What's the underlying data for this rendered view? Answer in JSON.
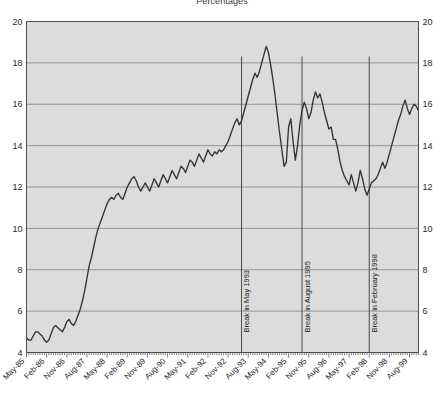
{
  "chart_data": {
    "type": "line",
    "title": "Percentages",
    "xlabel": "",
    "ylabel": "",
    "ylim": [
      4,
      20
    ],
    "yticks": [
      4,
      6,
      8,
      10,
      12,
      14,
      16,
      18,
      20
    ],
    "grid": true,
    "legend": "none",
    "y_axis_right": true,
    "x_tick_labels": [
      "May-85",
      "Feb-86",
      "Nov-86",
      "Aug-87",
      "May-88",
      "Feb-89",
      "Nov-89",
      "Aug-90",
      "May-91",
      "Feb-92",
      "Nov-92",
      "Aug-93",
      "May-94",
      "Feb-95",
      "Nov-95",
      "Aug-96",
      "May-97",
      "Feb-98",
      "Nov-98",
      "Aug-99",
      "May-00",
      "Feb-01"
    ],
    "x_label_interval_months": 9,
    "x_start": "May-85",
    "x_end": "Feb-01",
    "annotations": [
      {
        "label": "Break in May 1993",
        "x_value": "May-93"
      },
      {
        "label": "Break in August 1995",
        "x_value": "Aug-95"
      },
      {
        "label": "Break in February 1998",
        "x_value": "Feb-98"
      }
    ],
    "series": [
      {
        "name": "Percentage",
        "color": "#333333",
        "values": [
          4.7,
          4.6,
          4.6,
          4.8,
          5.0,
          5.0,
          4.9,
          4.8,
          4.6,
          4.5,
          4.6,
          4.9,
          5.2,
          5.3,
          5.2,
          5.1,
          5.0,
          5.2,
          5.5,
          5.6,
          5.4,
          5.3,
          5.5,
          5.8,
          6.1,
          6.5,
          7.0,
          7.6,
          8.2,
          8.6,
          9.1,
          9.6,
          10.0,
          10.3,
          10.6,
          10.9,
          11.2,
          11.4,
          11.5,
          11.4,
          11.6,
          11.7,
          11.5,
          11.4,
          11.7,
          12.0,
          12.2,
          12.4,
          12.5,
          12.3,
          12.0,
          11.8,
          12.0,
          12.2,
          12.0,
          11.8,
          12.1,
          12.4,
          12.2,
          12.0,
          12.3,
          12.6,
          12.4,
          12.2,
          12.5,
          12.8,
          12.6,
          12.4,
          12.7,
          13.0,
          12.9,
          12.7,
          13.0,
          13.3,
          13.2,
          13.0,
          13.3,
          13.6,
          13.4,
          13.2,
          13.5,
          13.8,
          13.6,
          13.5,
          13.7,
          13.6,
          13.8,
          13.7,
          13.8,
          14.0,
          14.2,
          14.5,
          14.8,
          15.1,
          15.3,
          15.0,
          15.2,
          15.6,
          16.0,
          16.4,
          16.8,
          17.2,
          17.5,
          17.3,
          17.6,
          18.0,
          18.4,
          18.8,
          18.5,
          17.9,
          17.2,
          16.4,
          15.5,
          14.6,
          13.8,
          13.0,
          13.2,
          14.9,
          15.3,
          14.2,
          13.3,
          14.0,
          15.0,
          15.7,
          16.1,
          15.8,
          15.3,
          15.6,
          16.2,
          16.6,
          16.3,
          16.5,
          16.1,
          15.6,
          15.2,
          14.8,
          14.9,
          14.3,
          14.3,
          13.8,
          13.2,
          12.8,
          12.5,
          12.3,
          12.1,
          12.6,
          12.2,
          11.8,
          12.2,
          12.8,
          12.4,
          11.9,
          11.6,
          11.9,
          12.2,
          12.3,
          12.4,
          12.6,
          12.9,
          13.2,
          12.9,
          13.2,
          13.6,
          14.0,
          14.4,
          14.8,
          15.2,
          15.5,
          15.9,
          16.2,
          15.8,
          15.5,
          15.8,
          16.0,
          15.9,
          15.7
        ]
      }
    ]
  },
  "axis": {
    "left_ticks": [
      "20",
      "18",
      "16",
      "14",
      "12",
      "10",
      "8",
      "6",
      "4"
    ],
    "right_ticks": [
      "20",
      "18",
      "16",
      "14",
      "12",
      "10",
      "8",
      "6",
      "4"
    ]
  },
  "colors": {
    "plot_background": "#dcdcdc",
    "grid": "#808080",
    "frame": "#4d4d4d",
    "line": "#333333",
    "break_line": "#3a3a3a",
    "page_background": "#ffffff"
  }
}
